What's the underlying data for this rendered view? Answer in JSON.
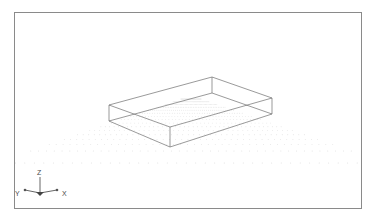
{
  "viewport": {
    "name": "3d-modeling-viewport",
    "background_color": "#ffffff",
    "border_color": "#8a8a8a",
    "width": 383,
    "height": 220
  },
  "axis_indicator": {
    "name": "axis-tripod",
    "origin": {
      "x": 40,
      "y": 193
    },
    "axes": [
      {
        "key": "z",
        "label": "Z",
        "label_x": 40,
        "label_y": 174,
        "tip_x": 40,
        "tip_y": 177,
        "has_tick": false
      },
      {
        "key": "x",
        "label": "X",
        "label_x": 64,
        "label_y": 195,
        "tip_x": 56,
        "tip_y": 190,
        "has_tick": true
      },
      {
        "key": "y",
        "label": "Y",
        "label_x": 18,
        "label_y": 195,
        "tip_x": 26,
        "tip_y": 190,
        "has_tick": true
      }
    ],
    "line_color": "#555555",
    "label_color": "#4a4a4a"
  },
  "grid": {
    "name": "perspective-dot-grid",
    "dot_color": "#c9c9c9",
    "dot_radius": 0.45,
    "rows": 16,
    "columns": 42,
    "description": "Receding isometric dot ground plane"
  },
  "model": {
    "name": "wireframe-box",
    "type": "open-top rectangular slab",
    "line_color": "#6e6e6e",
    "line_width": 0.7,
    "vertices": {
      "top_left": {
        "x": 108,
        "y": 104
      },
      "top_back": {
        "x": 211,
        "y": 76
      },
      "top_right": {
        "x": 271,
        "y": 97
      },
      "top_front": {
        "x": 169,
        "y": 126
      },
      "bottom_left": {
        "x": 108,
        "y": 120
      },
      "bottom_right": {
        "x": 271,
        "y": 113
      },
      "bottom_front": {
        "x": 169,
        "y": 146
      },
      "inner_back": {
        "x": 211,
        "y": 92
      }
    }
  }
}
